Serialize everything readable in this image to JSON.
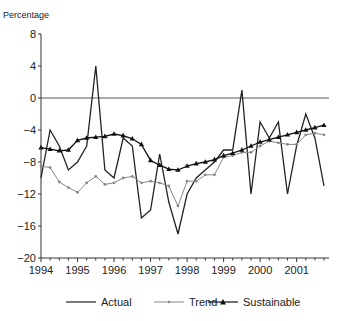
{
  "chart_data": {
    "type": "line",
    "title": "",
    "xlabel": "",
    "ylabel": "Percentage",
    "ylim": [
      -20,
      8
    ],
    "yticks": [
      8,
      4,
      0,
      -4,
      -8,
      -12,
      -16,
      -20
    ],
    "xtick_labels": [
      "1994",
      "1995",
      "1996",
      "1997",
      "1998",
      "1999",
      "2000",
      "2001"
    ],
    "frequency": "quarterly",
    "x": [
      "1994Q1",
      "1994Q2",
      "1994Q3",
      "1994Q4",
      "1995Q1",
      "1995Q2",
      "1995Q3",
      "1995Q4",
      "1996Q1",
      "1996Q2",
      "1996Q3",
      "1996Q4",
      "1997Q1",
      "1997Q2",
      "1997Q3",
      "1997Q4",
      "1998Q1",
      "1998Q2",
      "1998Q3",
      "1998Q4",
      "1999Q1",
      "1999Q2",
      "1999Q3",
      "1999Q4",
      "2000Q1",
      "2000Q2",
      "2000Q3",
      "2000Q4",
      "2001Q1",
      "2001Q2",
      "2001Q3",
      "2001Q4"
    ],
    "grid": false,
    "zero_line": true,
    "legend_position": "bottom",
    "series": [
      {
        "name": "Actual",
        "color": "#222222",
        "marker": "none",
        "values": [
          -10,
          -4,
          -6,
          -9,
          -8,
          -6,
          4,
          -9,
          -10,
          -5,
          -6,
          -15,
          -14,
          -7,
          -13,
          -17,
          -12,
          -10,
          -9,
          -8,
          -6.5,
          -6.5,
          1,
          -12,
          -3,
          -5,
          -3,
          -12,
          -6,
          -2,
          -5,
          -11
        ]
      },
      {
        "name": "Trend",
        "color": "#888888",
        "marker": "dot",
        "values": [
          -8.5,
          -8.7,
          -10.5,
          -11.2,
          -11.8,
          -10.6,
          -9.8,
          -10.8,
          -10.6,
          -10,
          -9.8,
          -10.6,
          -10.4,
          -10.6,
          -11,
          -13.5,
          -10.4,
          -10.4,
          -9.6,
          -9.6,
          -7.4,
          -7.2,
          -6.8,
          -6.8,
          -6,
          -5.4,
          -5.6,
          -5.8,
          -5.8,
          -4.6,
          -4.4,
          -4.6
        ]
      },
      {
        "name": "Sustainable",
        "color": "#111111",
        "marker": "triangle",
        "values": [
          -6.2,
          -6.4,
          -6.6,
          -6.5,
          -5.3,
          -5,
          -4.9,
          -4.8,
          -4.5,
          -4.7,
          -5.1,
          -5.8,
          -7.8,
          -8.4,
          -8.9,
          -9,
          -8.5,
          -8.2,
          -8,
          -7.7,
          -7.2,
          -6.9,
          -6.5,
          -6,
          -5.5,
          -5.2,
          -4.9,
          -4.6,
          -4.3,
          -4,
          -3.7,
          -3.4
        ]
      }
    ]
  },
  "legend": {
    "items": [
      {
        "label": "Actual"
      },
      {
        "label": "Trend"
      },
      {
        "label": "Sustainable"
      }
    ]
  },
  "axis": {
    "y_title": "Percentage"
  }
}
